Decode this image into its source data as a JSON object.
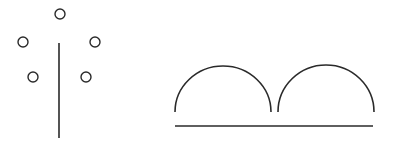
{
  "figure": {
    "width": 395,
    "height": 145,
    "background": "#ffffff",
    "stroke_color": "#2a2a2a",
    "left_figure": {
      "description": "vertical stem with five small circles arranged around its top",
      "stem": {
        "x": 59,
        "y1": 43,
        "y2": 138,
        "stroke_width": 1.6
      },
      "circles": [
        {
          "cx": 60,
          "cy": 14,
          "r": 5
        },
        {
          "cx": 23,
          "cy": 42,
          "r": 5
        },
        {
          "cx": 95,
          "cy": 42,
          "r": 5
        },
        {
          "cx": 33,
          "cy": 77,
          "r": 5
        },
        {
          "cx": 86,
          "cy": 77,
          "r": 5
        }
      ]
    },
    "right_figure": {
      "description": "two adjacent semicircular arcs above a horizontal baseline",
      "arcs": [
        {
          "x1": 175,
          "x2": 271,
          "base_y": 112,
          "top_y": 66
        },
        {
          "x1": 278,
          "x2": 374,
          "base_y": 112,
          "top_y": 65
        }
      ],
      "baseline": {
        "x1": 175,
        "x2": 373,
        "y": 126,
        "stroke_width": 1.6
      }
    }
  }
}
